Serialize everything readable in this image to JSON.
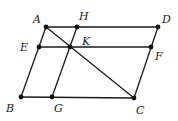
{
  "diagram": {
    "type": "geometry",
    "points": [
      {
        "name": "A",
        "x": 46,
        "y": 27,
        "label_x": 33,
        "label_y": 23
      },
      {
        "name": "H",
        "x": 77,
        "y": 27,
        "label_x": 79,
        "label_y": 20
      },
      {
        "name": "D",
        "x": 158,
        "y": 27,
        "label_x": 162,
        "label_y": 23
      },
      {
        "name": "E",
        "x": 39,
        "y": 47,
        "label_x": 20,
        "label_y": 51
      },
      {
        "name": "K",
        "x": 70,
        "y": 47,
        "label_x": 82,
        "label_y": 45
      },
      {
        "name": "F",
        "x": 151,
        "y": 47,
        "label_x": 155,
        "label_y": 60
      },
      {
        "name": "B",
        "x": 21,
        "y": 97,
        "label_x": 6,
        "label_y": 112
      },
      {
        "name": "G",
        "x": 52,
        "y": 97,
        "label_x": 54,
        "label_y": 112
      },
      {
        "name": "C",
        "x": 134,
        "y": 98,
        "label_x": 136,
        "label_y": 114
      }
    ],
    "segments": [
      [
        "A",
        "D"
      ],
      [
        "E",
        "F"
      ],
      [
        "B",
        "C"
      ],
      [
        "A",
        "B"
      ],
      [
        "H",
        "G"
      ],
      [
        "D",
        "C"
      ],
      [
        "A",
        "C"
      ]
    ]
  }
}
